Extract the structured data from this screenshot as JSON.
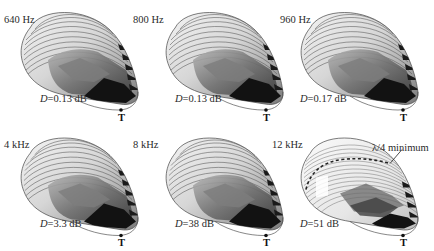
{
  "figure": {
    "type": "3D surface renderings (6 panels, 2 rows x 3 columns)",
    "marker_label": "T",
    "panels": [
      {
        "id": "p1",
        "frequency": "640 Hz",
        "d_symbol": "D",
        "d_value": "=0.13 dB",
        "style": "low"
      },
      {
        "id": "p2",
        "frequency": "800 Hz",
        "d_symbol": "D",
        "d_value": "=0.13 dB",
        "style": "low"
      },
      {
        "id": "p3",
        "frequency": "960 Hz",
        "d_symbol": "D",
        "d_value": "=0.17 dB",
        "style": "low"
      },
      {
        "id": "p4",
        "frequency": "4 kHz",
        "d_symbol": "D",
        "d_value": "=3.3 dB",
        "style": "low"
      },
      {
        "id": "p5",
        "frequency": "8 kHz",
        "d_symbol": "D",
        "d_value": "=38 dB",
        "style": "mid"
      },
      {
        "id": "p6",
        "frequency": "12 kHz",
        "d_symbol": "D",
        "d_value": "=51 dB",
        "style": "high"
      }
    ],
    "annotation": {
      "text": "λ/4 minimum",
      "panel": "p6"
    },
    "colors": {
      "surface_light": "#e8e8e8",
      "surface_mid": "#8a8a8a",
      "surface_dark": "#111111",
      "contour": "#555555",
      "background": "#ffffff"
    }
  }
}
